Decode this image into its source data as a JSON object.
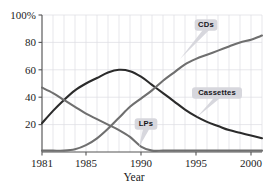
{
  "chart_data": {
    "type": "line",
    "title": "",
    "subtitle": "",
    "xlabel": "Year",
    "ylabel": "",
    "xlim": [
      1981,
      2001
    ],
    "ylim": [
      0,
      100
    ],
    "grid": true,
    "grid_style": "vertical gridlines at every year, horizontal gridlines at 20/40/60/80/100",
    "legend_position": "inline callout labels attached to curves",
    "x_tick_labels": [
      "1981",
      "1985",
      "1990",
      "1995",
      "2000"
    ],
    "x_ticks": [
      1981,
      1985,
      1990,
      1995,
      2000
    ],
    "y_tick_labels": [
      "20",
      "40",
      "60",
      "80",
      "100%"
    ],
    "y_ticks": [
      20,
      40,
      60,
      80,
      100
    ],
    "x": [
      1981,
      1982,
      1983,
      1984,
      1985,
      1986,
      1987,
      1988,
      1989,
      1990,
      1991,
      1992,
      1993,
      1994,
      1995,
      1996,
      1997,
      1998,
      1999,
      2000,
      2001
    ],
    "series": [
      {
        "name": "Cassettes",
        "color": "#2b2b2b",
        "width": 2.1,
        "values": [
          21,
          30,
          38,
          45,
          50,
          54,
          58,
          60,
          59,
          55,
          49,
          43,
          37,
          31,
          26,
          22,
          19,
          16,
          14,
          12,
          10
        ]
      },
      {
        "name": "LPs",
        "color": "#6f6f6f",
        "width": 2.1,
        "values": [
          47,
          43,
          38,
          33,
          28,
          24,
          20,
          16,
          11,
          4,
          1,
          1,
          1,
          1,
          1,
          1,
          1,
          1,
          1,
          1,
          1
        ]
      },
      {
        "name": "CDs",
        "color": "#6f6f6f",
        "width": 2.1,
        "values": [
          1,
          1,
          1,
          2,
          5,
          10,
          17,
          25,
          33,
          39,
          45,
          52,
          58,
          64,
          68,
          71,
          74,
          77,
          80,
          82,
          85
        ]
      }
    ],
    "annotations": [
      {
        "label": "CDs",
        "box_x": 206,
        "box_y": 25,
        "point_x": 180,
        "point_y": 59
      },
      {
        "label": "Cassettes",
        "box_x": 217,
        "box_y": 93,
        "point_x": 197,
        "point_y": 117
      },
      {
        "label": "LPs",
        "box_x": 146,
        "box_y": 124,
        "point_x": 139,
        "point_y": 147
      }
    ],
    "colors": {
      "axis": "#555555",
      "gridline": "#dcdce2",
      "text": "#1c1c1c",
      "callout_fill": "#d7d7dd",
      "dark_series": "#2b2b2b",
      "gray_series": "#6f6f6f",
      "background": "#ffffff"
    }
  }
}
